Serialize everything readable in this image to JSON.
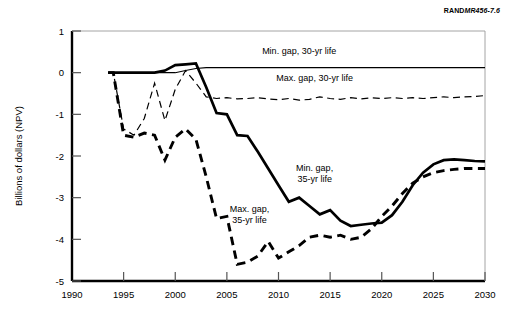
{
  "figure": {
    "source_tag_prefix": "RAND",
    "source_tag_id": "MR456-7.6"
  },
  "chart_data": {
    "type": "line",
    "title": "",
    "subtitle": "",
    "xlabel": "",
    "ylabel": "Billions of dollars (NPV)",
    "xlim": [
      1990,
      2030
    ],
    "ylim": [
      -5,
      1
    ],
    "xticks": [
      1990,
      1995,
      2000,
      2005,
      2010,
      2015,
      2020,
      2025,
      2030
    ],
    "xticklabels": [
      "1990",
      "1995",
      "2000",
      "2005",
      "2010",
      "2015",
      "2020",
      "2025",
      "2030"
    ],
    "yticks": [
      1,
      0,
      -1,
      -2,
      -3,
      -4,
      -5
    ],
    "yticklabels": [
      "1",
      "0",
      "-1",
      "-2",
      "-3",
      "-4",
      "-5"
    ],
    "grid": false,
    "legend_position": "inline-annotations",
    "series": [
      {
        "name": "Min. gap, 30-yr life",
        "label": "Min. gap, 30-yr life",
        "style": "solid-thin",
        "color": "#000000",
        "linewidth": 1.1,
        "x": [
          1993.5,
          1994,
          1995,
          1996,
          1997,
          1998,
          1999,
          2000,
          2001,
          2002,
          2003,
          2004,
          2005,
          2006,
          2007,
          2008,
          2009,
          2010,
          2011,
          2012,
          2013,
          2014,
          2015,
          2016,
          2017,
          2018,
          2019,
          2020,
          2021,
          2022,
          2023,
          2024,
          2025,
          2026,
          2027,
          2028,
          2029,
          2030
        ],
        "y": [
          0.0,
          0.0,
          0.0,
          0.0,
          0.0,
          0.0,
          0.0,
          0.0,
          0.05,
          0.1,
          0.12,
          0.12,
          0.12,
          0.12,
          0.12,
          0.12,
          0.12,
          0.12,
          0.12,
          0.12,
          0.12,
          0.12,
          0.12,
          0.12,
          0.12,
          0.12,
          0.12,
          0.12,
          0.12,
          0.12,
          0.12,
          0.12,
          0.12,
          0.12,
          0.12,
          0.12,
          0.12,
          0.12
        ]
      },
      {
        "name": "Max. gap, 30-yr life",
        "label": "Max. gap, 30-yr life",
        "style": "dashed-thin",
        "color": "#000000",
        "linewidth": 1.1,
        "x": [
          1993.5,
          1994,
          1995,
          1996,
          1997,
          1998,
          1999,
          2000,
          2001,
          2002,
          2003,
          2004,
          2005,
          2006,
          2007,
          2008,
          2009,
          2010,
          2011,
          2012,
          2013,
          2014,
          2015,
          2016,
          2017,
          2018,
          2019,
          2020,
          2021,
          2022,
          2023,
          2024,
          2025,
          2026,
          2027,
          2028,
          2029,
          2030
        ],
        "y": [
          0.0,
          0.0,
          -1.35,
          -1.5,
          -1.1,
          -0.25,
          -1.15,
          -0.4,
          0.05,
          -0.25,
          -0.58,
          -0.62,
          -0.6,
          -0.63,
          -0.62,
          -0.6,
          -0.63,
          -0.65,
          -0.62,
          -0.66,
          -0.64,
          -0.58,
          -0.62,
          -0.64,
          -0.6,
          -0.63,
          -0.6,
          -0.62,
          -0.6,
          -0.62,
          -0.6,
          -0.62,
          -0.6,
          -0.58,
          -0.6,
          -0.58,
          -0.57,
          -0.55
        ]
      },
      {
        "name": "Min. gap, 35-yr life",
        "label": "Min. gap, 35-yr life",
        "style": "solid-thick",
        "color": "#000000",
        "linewidth": 2.6,
        "x": [
          1993.5,
          1994,
          1995,
          1996,
          1997,
          1998,
          1999,
          2000,
          2001,
          2002,
          2003,
          2004,
          2005,
          2006,
          2007,
          2008,
          2009,
          2010,
          2011,
          2012,
          2013,
          2014,
          2015,
          2016,
          2017,
          2018,
          2019,
          2020,
          2021,
          2022,
          2023,
          2024,
          2025,
          2026,
          2027,
          2028,
          2029,
          2030
        ],
        "y": [
          0.0,
          0.0,
          0.0,
          0.0,
          0.0,
          0.0,
          0.05,
          0.18,
          0.2,
          0.22,
          -0.35,
          -0.97,
          -1.0,
          -1.5,
          -1.52,
          -1.9,
          -2.3,
          -2.7,
          -3.1,
          -3.0,
          -3.2,
          -3.4,
          -3.3,
          -3.55,
          -3.68,
          -3.65,
          -3.62,
          -3.6,
          -3.42,
          -3.1,
          -2.7,
          -2.4,
          -2.2,
          -2.1,
          -2.08,
          -2.1,
          -2.12,
          -2.13
        ]
      },
      {
        "name": "Max. gap, 35-yr life",
        "label": "Max. gap, 35-yr life",
        "style": "dashed-thick",
        "color": "#000000",
        "linewidth": 2.8,
        "x": [
          1993.5,
          1994,
          1995,
          1996,
          1997,
          1998,
          1999,
          2000,
          2001,
          2002,
          2003,
          2004,
          2005,
          2006,
          2007,
          2008,
          2009,
          2010,
          2011,
          2012,
          2013,
          2014,
          2015,
          2016,
          2017,
          2018,
          2019,
          2020,
          2021,
          2022,
          2023,
          2024,
          2025,
          2026,
          2027,
          2028,
          2029,
          2030
        ],
        "y": [
          0.0,
          0.0,
          -1.5,
          -1.55,
          -1.45,
          -1.5,
          -2.1,
          -1.55,
          -1.35,
          -1.6,
          -2.5,
          -3.5,
          -3.45,
          -4.6,
          -4.55,
          -4.4,
          -4.05,
          -4.45,
          -4.3,
          -4.15,
          -3.95,
          -3.9,
          -3.95,
          -3.9,
          -4.0,
          -3.95,
          -3.75,
          -3.45,
          -3.2,
          -2.9,
          -2.65,
          -2.5,
          -2.4,
          -2.35,
          -2.32,
          -2.3,
          -2.3,
          -2.3
        ]
      }
    ],
    "annotations": [
      {
        "text": "Min. gap, 30-yr life",
        "x": 2012.0,
        "y": 0.45,
        "anchor": "middle"
      },
      {
        "text": "Max. gap, 30-yr life",
        "x": 2013.5,
        "y": -0.2,
        "anchor": "middle"
      },
      {
        "text_line1": "Min. gap,",
        "text_line2": "35-yr life",
        "x": 2013.5,
        "y": -2.35,
        "anchor": "middle"
      },
      {
        "text_line1": "Max. gap,",
        "text_line2": "35-yr life",
        "x": 2007.2,
        "y": -3.35,
        "anchor": "middle"
      }
    ]
  }
}
